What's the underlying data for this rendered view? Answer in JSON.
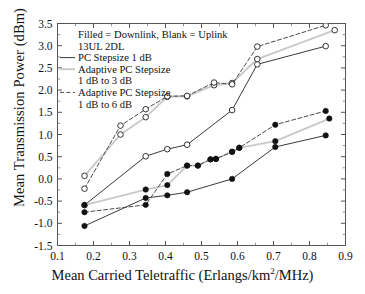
{
  "chart_data": {
    "type": "line",
    "title": "",
    "xlabel": "Mean Carried Teletraffic (Erlangs/km2/MHz)",
    "ylabel": "Mean Transmission Power (dBm)",
    "xlim": [
      0.1,
      0.9
    ],
    "ylim": [
      -1.5,
      3.5
    ],
    "xticks": [
      "0.1",
      "0.2",
      "0.3",
      "0.4",
      "0.5",
      "0.6",
      "0.7",
      "0.8",
      "0.9"
    ],
    "xtick_values": [
      0.1,
      0.2,
      0.3,
      0.4,
      0.5,
      0.6,
      0.7,
      0.8,
      0.9
    ],
    "yticks": [
      "-1.5",
      "-1.0",
      "-0.5",
      "0.0",
      "0.5",
      "1.0",
      "1.5",
      "2.0",
      "2.5",
      "3.0",
      "3.5"
    ],
    "ytick_values": [
      -1.5,
      -1.0,
      -0.5,
      0.0,
      0.5,
      1.0,
      1.5,
      2.0,
      2.5,
      3.0,
      3.5
    ],
    "grid": false,
    "legend_position": "upper-left-inside",
    "annotations": [
      "Filled = Downlink, Blank = Uplink",
      "13UL 2DL"
    ],
    "legend": [
      "PC Stepsize 1 dB",
      "Adaptive PC Stepsize",
      "1 dB to 3 dB",
      "Adaptive PC Stepsize",
      "1 dB to 6 dB"
    ],
    "series": [
      {
        "name": "Uplink - PC Stepsize 1 dB",
        "link": "uplink",
        "marker": "open-circle",
        "linestyle": "solid",
        "color": "#3a3a3a",
        "x": [
          0.175,
          0.345,
          0.405,
          0.46,
          0.585,
          0.655,
          0.845
        ],
        "y": [
          -0.59,
          0.51,
          0.67,
          0.77,
          1.55,
          2.58,
          2.99
        ]
      },
      {
        "name": "Uplink - Adaptive PC Stepsize 1 dB to 3 dB",
        "link": "uplink",
        "marker": "open-circle",
        "linestyle": "solid-light",
        "color": "#c9c9c9",
        "x": [
          0.175,
          0.275,
          0.345,
          0.405,
          0.46,
          0.535,
          0.585,
          0.655,
          0.87
        ],
        "y": [
          0.07,
          1.0,
          1.39,
          1.85,
          1.86,
          2.11,
          2.16,
          2.7,
          3.35
        ]
      },
      {
        "name": "Uplink - Adaptive PC Stepsize 1 dB to 6 dB",
        "link": "uplink",
        "marker": "open-circle",
        "linestyle": "dashed",
        "color": "#4a4a4a",
        "x": [
          0.175,
          0.275,
          0.345,
          0.405,
          0.46,
          0.535,
          0.585,
          0.655,
          0.845
        ],
        "y": [
          -0.22,
          1.2,
          1.57,
          1.86,
          1.87,
          2.17,
          2.13,
          2.98,
          3.46
        ]
      },
      {
        "name": "Downlink - PC Stepsize 1 dB",
        "link": "downlink",
        "marker": "filled-circle",
        "linestyle": "solid",
        "color": "#3a3a3a",
        "x": [
          0.175,
          0.345,
          0.405,
          0.46,
          0.585,
          0.705,
          0.845
        ],
        "y": [
          -1.06,
          -0.43,
          -0.37,
          -0.3,
          0.0,
          0.72,
          0.98
        ]
      },
      {
        "name": "Downlink - Adaptive PC Stepsize 1 dB to 3 dB",
        "link": "downlink",
        "marker": "filled-circle",
        "linestyle": "solid-light",
        "color": "#c9c9c9",
        "x": [
          0.175,
          0.345,
          0.405,
          0.46,
          0.49,
          0.525,
          0.54,
          0.585,
          0.605,
          0.705,
          0.855
        ],
        "y": [
          -0.59,
          -0.24,
          -0.14,
          0.3,
          0.3,
          0.44,
          0.45,
          0.61,
          0.7,
          0.85,
          1.36
        ]
      },
      {
        "name": "Downlink - Adaptive PC Stepsize 1 dB to 6 dB",
        "link": "downlink",
        "marker": "filled-circle",
        "linestyle": "dashed",
        "color": "#4a4a4a",
        "x": [
          0.175,
          0.345,
          0.405,
          0.46,
          0.49,
          0.525,
          0.54,
          0.585,
          0.605,
          0.705,
          0.845
        ],
        "y": [
          -0.75,
          -0.585,
          0.11,
          0.3,
          0.3,
          0.44,
          0.45,
          0.61,
          0.7,
          1.22,
          1.53
        ]
      }
    ]
  }
}
